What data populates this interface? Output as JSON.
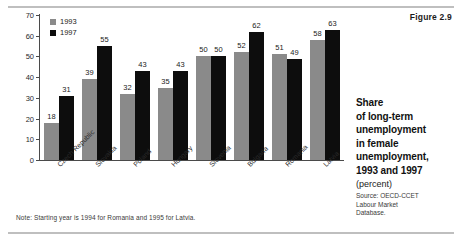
{
  "figure": {
    "label": "Figure 2.9"
  },
  "caption": {
    "title_lines": [
      "Share",
      "of long-term",
      "unemployment",
      "in female",
      "unemployment,",
      "1993 and 1997"
    ],
    "unit": "(percent)",
    "source_lines": [
      "Source: OECD-CCET",
      "Labour Market",
      "Database."
    ]
  },
  "note": "Note: Starting year is 1994 for Romania and 1995 for Latvia.",
  "colors": {
    "series_1993": "#8a8a8a",
    "series_1997": "#0d0d0d",
    "axis": "#4a4a4a",
    "rule": "#bfbfbf",
    "text": "#1b1b1b"
  },
  "chart_data": {
    "type": "bar",
    "xlabel": "",
    "ylabel": "",
    "unit": "percent",
    "ylim": [
      0,
      70
    ],
    "yticks": [
      0,
      10,
      20,
      30,
      40,
      50,
      60,
      70
    ],
    "grid": false,
    "legend_position": "top-left",
    "categories": [
      "Czech Republic",
      "Slovakia",
      "Poland",
      "Hungary",
      "Slovenia",
      "Bulgaria",
      "Romania",
      "Latvia"
    ],
    "series": [
      {
        "name": "1993",
        "color": "#8a8a8a",
        "values": [
          18,
          39,
          32,
          35,
          50,
          52,
          51,
          58
        ]
      },
      {
        "name": "1997",
        "color": "#0d0d0d",
        "values": [
          31,
          55,
          43,
          43,
          50,
          62,
          49,
          63
        ]
      }
    ]
  }
}
